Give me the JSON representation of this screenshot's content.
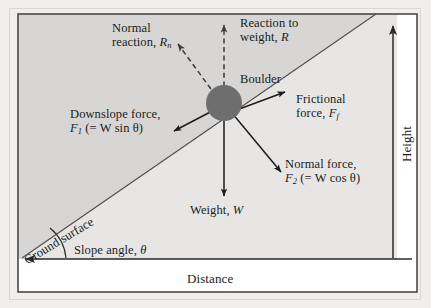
{
  "figure": {
    "type": "free-body-diagram",
    "axes": {
      "x_label": "Distance",
      "y_label": "Height"
    },
    "ground": {
      "surface_label": "Ground surface",
      "angle_label": "Slope angle, ",
      "angle_symbol": "θ"
    },
    "object": {
      "label": "Boulder",
      "color": "#6e6e6e"
    },
    "colors": {
      "upper_fill": "#d6d5d3",
      "lower_fill": "#e6e5e3",
      "frame": "#4a4a4a",
      "ink": "#1c1c1c",
      "page": "#f0efed"
    },
    "forces": [
      {
        "name": "normal-reaction",
        "line1": "Normal",
        "line2_pre": "reaction, ",
        "line2_sym": "R",
        "line2_sub": "n",
        "style": "dashed",
        "direction": "up-slope-normal-left"
      },
      {
        "name": "reaction-to-weight",
        "line1": "Reaction to",
        "line2_pre": "weight, ",
        "line2_sym": "R",
        "line2_sub": "",
        "style": "dashed",
        "direction": "up"
      },
      {
        "name": "downslope-force",
        "line1": "Downslope force,",
        "line2_sym": "F",
        "line2_sub": "1",
        "line2_expr": " (= W sin θ)",
        "style": "solid",
        "direction": "down-slope-left"
      },
      {
        "name": "frictional-force",
        "line1": "Frictional",
        "line2_pre": "force, ",
        "line2_sym": "F",
        "line2_sub": "f",
        "style": "solid",
        "direction": "up-slope-right"
      },
      {
        "name": "normal-force",
        "line1": "Normal force,",
        "line2_sym": "F",
        "line2_sub": "2",
        "line2_expr": " (= W cos θ)",
        "style": "solid",
        "direction": "down-slope-normal-right"
      },
      {
        "name": "weight",
        "line1_pre": "Weight, ",
        "line1_sym": "W",
        "style": "solid",
        "direction": "down"
      }
    ]
  }
}
